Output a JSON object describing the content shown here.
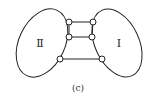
{
  "diagram": {
    "regions": [
      {
        "id": "II",
        "label": "Ⅱ"
      },
      {
        "id": "I",
        "label": "Ⅰ"
      }
    ],
    "connections": [
      {
        "from": "II",
        "to": "I",
        "row": "top"
      },
      {
        "from": "II",
        "to": "I",
        "row": "middle"
      },
      {
        "from": "II",
        "to": "I",
        "row": "bottom"
      }
    ],
    "caption": "(c)"
  }
}
